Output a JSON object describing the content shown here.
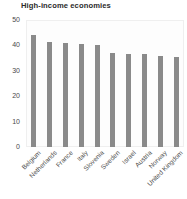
{
  "chart_data": {
    "type": "bar",
    "title": "High-income economies",
    "xlabel": "",
    "ylabel": "",
    "ylim": [
      0,
      50
    ],
    "yticks": [
      0,
      10,
      20,
      30,
      40,
      50
    ],
    "ytick_labels": [
      "0",
      "10",
      "20",
      "30",
      "40",
      "50"
    ],
    "grid": false,
    "legend": null,
    "bar_color": "#8a8a8a",
    "categories": [
      "Belgium",
      "Netherlands",
      "France",
      "Italy",
      "Slovenia",
      "Sweden",
      "Israel",
      "Austria",
      "Norway",
      "United Kingdom"
    ],
    "values": [
      44,
      41.5,
      41,
      40.5,
      40,
      37,
      36.5,
      36.5,
      36,
      35.5
    ]
  }
}
